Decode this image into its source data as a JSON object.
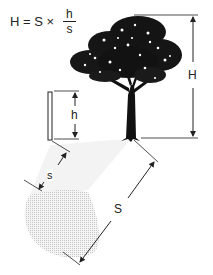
{
  "formula": {
    "lhs": "H = S ×",
    "numerator": "h",
    "denominator": "s"
  },
  "labels": {
    "tree_height": "H",
    "stick_height": "h",
    "stick_shadow": "s",
    "tree_shadow": "S"
  },
  "colors": {
    "line": "#222222",
    "shadow": "#d8d8d8",
    "tree": "#111111"
  }
}
